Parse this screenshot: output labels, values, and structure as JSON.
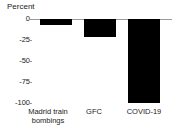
{
  "chart_data": {
    "type": "bar",
    "title": "",
    "ylabel": "Percent",
    "xlabel": "",
    "categories": [
      "Madrid train bombings",
      "GFC",
      "COVID-19"
    ],
    "values": [
      -7,
      -21,
      -100
    ],
    "yticks": [
      "0",
      "-25",
      "-50",
      "-75",
      "-100"
    ],
    "ytick_values": [
      0,
      -25,
      -50,
      -75,
      -100
    ],
    "ylim": [
      -100,
      0
    ],
    "grid": false,
    "legend": "none",
    "bar_color": "#000000",
    "axis_color": "#9a9a9a",
    "background": "#ffffff"
  }
}
